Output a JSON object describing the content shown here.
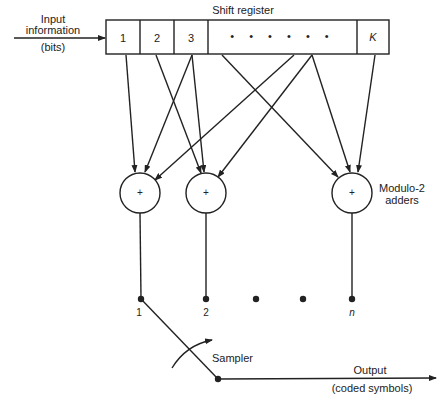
{
  "title": "Shift register",
  "input": {
    "line1": "Input",
    "line2": "information",
    "line3": "(bits)"
  },
  "cells": [
    {
      "label": "1"
    },
    {
      "label": "2"
    },
    {
      "label": "3"
    },
    {
      "label": "• • • • • •"
    },
    {
      "label": "K"
    }
  ],
  "adders": {
    "symbol": "+",
    "label_line1": "Modulo-2",
    "label_line2": "adders"
  },
  "taps": [
    {
      "label": "1"
    },
    {
      "label": "2"
    },
    {
      "label": "n"
    }
  ],
  "sampler": "Sampler",
  "output": {
    "line1": "Output",
    "line2": "(coded symbols)"
  },
  "colors": {
    "ink": "#222222",
    "background": "#ffffff"
  }
}
